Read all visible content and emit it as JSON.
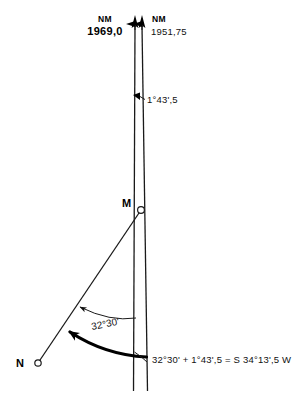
{
  "figure": {
    "type": "navigation-bearing-diagram",
    "background": "#ffffff",
    "ink_color": "#1a1a1a"
  },
  "labels": {
    "nm_left_unit": "NM",
    "nm_left_value": "1969,0",
    "nm_right_unit": "NM",
    "nm_right_value": "1951,75",
    "convergence_angle": "1°43',5",
    "station_m": "M",
    "station_n": "N",
    "bearing_angle": "32°30'",
    "formula": "32°30' + 1°43',5 = S 34°13',5 W"
  },
  "icons": {
    "north_arrow_left": "north-arrow-icon",
    "north_arrow_right": "north-arrow-icon",
    "angle_pointer": "angle-pointer-icon",
    "arc_arrow": "arc-arrow-icon"
  },
  "geometry": {
    "grid_north_line_x_top": 135,
    "true_north_line_x_top": 142,
    "point_m": [
      141,
      210
    ],
    "point_n": [
      38,
      363
    ],
    "line_bottom_y": 391
  }
}
